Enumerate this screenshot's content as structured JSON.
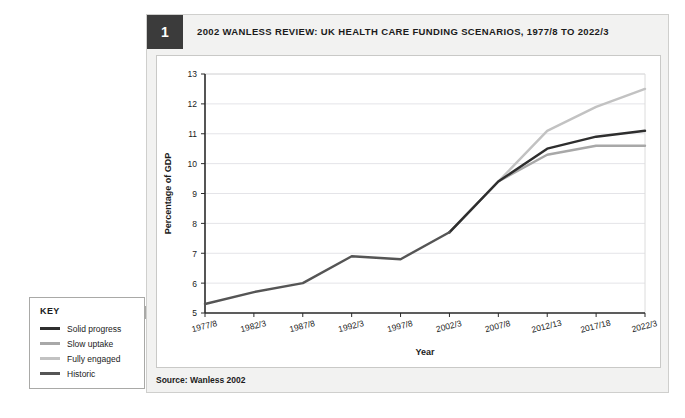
{
  "figure": {
    "number": "1",
    "title": "2002 WANLESS REVIEW: UK HEALTH CARE FUNDING SCENARIOS, 1977/8 TO 2022/3",
    "source": "Source: Wanless 2002"
  },
  "key": {
    "title": "KEY",
    "items": [
      {
        "label": "Solid progress",
        "color": "#2e2e2e"
      },
      {
        "label": "Slow uptake",
        "color": "#a8a8a8"
      },
      {
        "label": "Fully engaged",
        "color": "#c2c2c2"
      },
      {
        "label": "Historic",
        "color": "#555555"
      }
    ]
  },
  "chart_data": {
    "type": "line",
    "title": "2002 Wanless Review: UK health care funding scenarios, 1977/8 to 2022/3",
    "xlabel": "Year",
    "ylabel": "Percentage of GDP",
    "categories": [
      "1977/8",
      "1982/3",
      "1987/8",
      "1992/3",
      "1997/8",
      "2002/3",
      "2007/8",
      "2012/13",
      "2017/18",
      "2022/3"
    ],
    "ylim": [
      5,
      13
    ],
    "yticks": [
      5,
      6,
      7,
      8,
      9,
      10,
      11,
      12,
      13
    ],
    "grid": true,
    "legend_position": "external-left-key-box",
    "series": [
      {
        "name": "Historic",
        "color": "#555555",
        "values": [
          5.3,
          5.7,
          6.0,
          6.9,
          6.8,
          7.7,
          null,
          null,
          null,
          null
        ]
      },
      {
        "name": "Solid progress",
        "color": "#2e2e2e",
        "values": [
          null,
          null,
          null,
          null,
          null,
          7.7,
          9.4,
          10.5,
          10.9,
          11.1
        ]
      },
      {
        "name": "Slow uptake",
        "color": "#a8a8a8",
        "values": [
          null,
          null,
          null,
          null,
          null,
          7.7,
          9.4,
          10.3,
          10.6,
          10.6
        ]
      },
      {
        "name": "Fully engaged",
        "color": "#c2c2c2",
        "values": [
          null,
          null,
          null,
          null,
          null,
          7.7,
          9.4,
          11.1,
          11.9,
          12.5
        ]
      }
    ]
  }
}
